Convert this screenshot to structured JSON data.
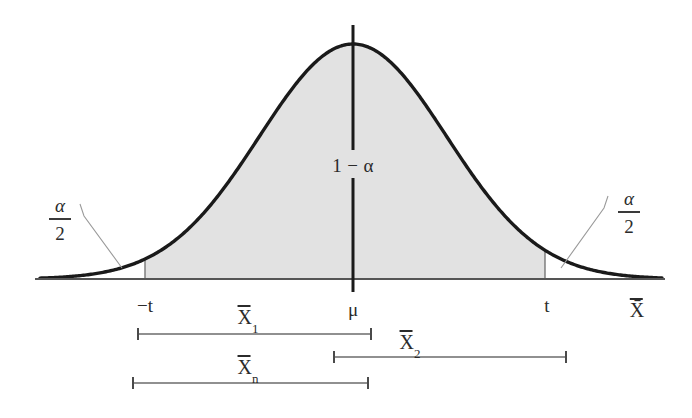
{
  "figure": {
    "type": "normal-distribution-confidence-interval-diagram",
    "title": "",
    "colors": {
      "curve": "#1a1a1a",
      "shading": "#e2e2e2",
      "axis": "#555555",
      "leader": "#8a8a8a",
      "text": "#2b2b2b",
      "background": "#ffffff"
    }
  },
  "curve": {
    "center_x": 353,
    "baseline_y": 279,
    "peak_y": 44,
    "left_end_x": 40,
    "right_end_x": 662
  },
  "axis": {
    "baseline_y": 279,
    "x_start": 35,
    "x_end": 665,
    "axis_label": "X̄",
    "axis_label_plain": "X-bar"
  },
  "center_line": {
    "x": 353,
    "top_y": 25,
    "bottom_y": 292,
    "gap_top_y": 150,
    "gap_bottom_y": 178
  },
  "shaded_region": {
    "left_x": 145,
    "right_x": 545,
    "label": "1 − α",
    "label_x": 353,
    "label_y": 165,
    "fill": "#e2e2e2"
  },
  "tails": [
    {
      "side": "left",
      "label_numerator": "α",
      "label_denominator": "2",
      "label_x": 60,
      "label_y": 196,
      "leader_from_x": 84,
      "leader_from_y": 216,
      "leader_to_x": 122,
      "leader_to_y": 268
    },
    {
      "side": "right",
      "label_numerator": "α",
      "label_denominator": "2",
      "label_x": 629,
      "label_y": 189,
      "leader_from_x": 604,
      "leader_from_y": 208,
      "leader_to_x": 561,
      "leader_to_y": 268
    }
  ],
  "tick_labels": [
    {
      "name": "neg-t",
      "text": "−t",
      "x": 145,
      "y": 296
    },
    {
      "name": "mu",
      "text": "μ",
      "x": 353,
      "y": 300
    },
    {
      "name": "pos-t",
      "text": "t",
      "x": 546,
      "y": 296
    },
    {
      "name": "xbar-axis",
      "text": "X̄",
      "x": 637,
      "y": 300
    }
  ],
  "intervals": [
    {
      "name": "xbar-1",
      "label_char": "X",
      "label_sub": "1",
      "label_x": 248,
      "label_y": 305,
      "left_x": 138,
      "right_x": 371,
      "y": 334
    },
    {
      "name": "xbar-2",
      "label_char": "X",
      "label_sub": "2",
      "label_x": 403,
      "label_y": 330,
      "left_x": 334,
      "right_x": 566,
      "y": 357
    },
    {
      "name": "xbar-n",
      "label_char": "X",
      "label_sub": "n",
      "label_x": 248,
      "label_y": 355,
      "left_x": 133,
      "right_x": 368,
      "y": 383
    }
  ]
}
